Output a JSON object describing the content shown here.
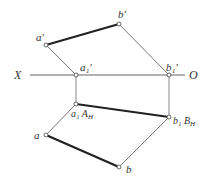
{
  "diagram": {
    "type": "descriptive-geometry-projection",
    "axis": {
      "left_label": "X",
      "right_label": "O"
    },
    "points": {
      "a_prime": {
        "label": "a′",
        "x": 46,
        "y": 45
      },
      "b_prime": {
        "label": "b′",
        "x": 119,
        "y": 24
      },
      "a1_prime": {
        "label": "a₁′",
        "x": 76,
        "y": 75
      },
      "b1_prime": {
        "label": "b₁′",
        "x": 169,
        "y": 75
      },
      "a1": {
        "label": "a₁ A",
        "sub": "H",
        "x": 76,
        "y": 104
      },
      "b1": {
        "label": "b₁ B",
        "sub": "H",
        "x": 169,
        "y": 117
      },
      "a": {
        "label": "a",
        "x": 46,
        "y": 135
      },
      "b": {
        "label": "b",
        "x": 119,
        "y": 167
      }
    },
    "colors": {
      "line": "#555555",
      "thick": "#222222",
      "thin": "#777777"
    }
  }
}
